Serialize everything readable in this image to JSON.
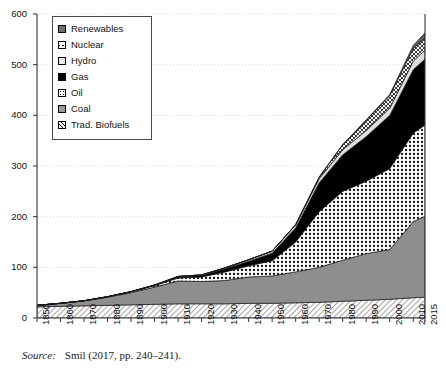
{
  "figure": {
    "source_label": "Source:",
    "source_text": "Smil (2017, pp. 240–241)."
  },
  "legend": {
    "items": [
      {
        "label": "Renewables",
        "swatch": "renewables-swatch",
        "pattern": "solid-dark-gray",
        "color": "#6e6e6e"
      },
      {
        "label": "Nuclear",
        "swatch": "nuclear-swatch",
        "pattern": "cross-hatch",
        "color": "#ffffff"
      },
      {
        "label": "Hydro",
        "swatch": "hydro-swatch",
        "pattern": "solid-light",
        "color": "#e9e9e9"
      },
      {
        "label": "Gas",
        "swatch": "gas-swatch",
        "pattern": "solid-black",
        "color": "#000000"
      },
      {
        "label": "Oil",
        "swatch": "oil-swatch",
        "pattern": "dotted",
        "color": "#ffffff"
      },
      {
        "label": "Coal",
        "swatch": "coal-swatch",
        "pattern": "solid-gray",
        "color": "#9a9a9a"
      },
      {
        "label": "Trad. Biofuels",
        "swatch": "biofuels-swatch",
        "pattern": "diagonal-hatch",
        "color": "#ffffff"
      }
    ]
  },
  "chart_data": {
    "type": "area",
    "stacked": true,
    "title": "",
    "xlabel": "",
    "ylabel": "",
    "xlim": [
      1850,
      2015
    ],
    "ylim": [
      0,
      600
    ],
    "ytick_values": [
      0,
      100,
      200,
      300,
      400,
      500,
      600
    ],
    "ytick_labels": [
      "0",
      "100",
      "200",
      "300",
      "400",
      "500",
      "600"
    ],
    "xtick_values": [
      1850,
      1860,
      1870,
      1880,
      1890,
      1900,
      1910,
      1920,
      1930,
      1940,
      1950,
      1960,
      1970,
      1980,
      1990,
      2000,
      2010,
      2015
    ],
    "xtick_labels": [
      "1850",
      "1860",
      "1870",
      "1880",
      "1890",
      "1900",
      "1910",
      "1920",
      "1930",
      "1940",
      "1950",
      "1960",
      "1970",
      "1980",
      "1990",
      "2000",
      "2010",
      "2015"
    ],
    "grid": "horizontal-dotted",
    "legend_position": "top-left-inside",
    "x": [
      1850,
      1860,
      1870,
      1880,
      1890,
      1900,
      1910,
      1920,
      1930,
      1940,
      1950,
      1960,
      1970,
      1980,
      1990,
      2000,
      2010,
      2015
    ],
    "series": [
      {
        "name": "Trad. Biofuels",
        "stack_order": 1,
        "values": [
          22,
          23,
          24,
          25,
          26,
          27,
          28,
          28,
          28,
          29,
          29,
          30,
          31,
          33,
          35,
          37,
          40,
          41
        ]
      },
      {
        "name": "Coal",
        "stack_order": 2,
        "values": [
          3,
          6,
          10,
          16,
          24,
          34,
          45,
          44,
          46,
          52,
          54,
          61,
          69,
          81,
          92,
          98,
          150,
          160
        ]
      },
      {
        "name": "Oil",
        "stack_order": 3,
        "values": [
          0,
          0,
          0,
          1,
          2,
          3,
          6,
          9,
          17,
          22,
          30,
          59,
          110,
          136,
          143,
          160,
          175,
          180
        ]
      },
      {
        "name": "Gas",
        "stack_order": 4,
        "values": [
          0,
          0,
          0,
          0,
          0,
          1,
          2,
          3,
          6,
          9,
          15,
          28,
          57,
          72,
          88,
          105,
          125,
          130
        ]
      },
      {
        "name": "Hydro",
        "stack_order": 5,
        "values": [
          0,
          0,
          0,
          0,
          0,
          0,
          1,
          1,
          2,
          3,
          4,
          6,
          8,
          10,
          12,
          14,
          17,
          18
        ]
      },
      {
        "name": "Nuclear",
        "stack_order": 6,
        "values": [
          0,
          0,
          0,
          0,
          0,
          0,
          0,
          0,
          0,
          0,
          0,
          0,
          3,
          10,
          20,
          25,
          25,
          24
        ]
      },
      {
        "name": "Renewables",
        "stack_order": 7,
        "values": [
          0,
          0,
          0,
          0,
          0,
          0,
          0,
          0,
          0,
          0,
          0,
          0,
          0,
          0,
          1,
          2,
          6,
          10
        ]
      }
    ],
    "stack_totals": [
      25,
      29,
      34,
      42,
      52,
      65,
      82,
      85,
      99,
      115,
      132,
      184,
      278,
      342,
      391,
      441,
      538,
      563
    ]
  }
}
